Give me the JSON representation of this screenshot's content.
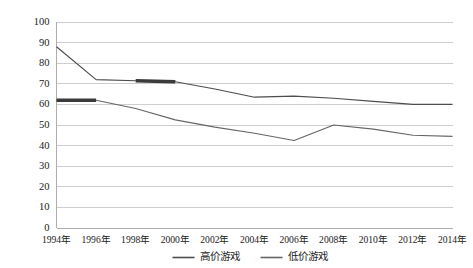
{
  "chart_data": {
    "type": "line",
    "title": "",
    "xlabel": "",
    "ylabel": "",
    "ylim": [
      0,
      100
    ],
    "ytick_step": 10,
    "grid": true,
    "legend_position": "bottom",
    "categories": [
      "1994年",
      "1996年",
      "1998年",
      "2000年",
      "2002年",
      "2004年",
      "2006年",
      "2008年",
      "2010年",
      "2012年",
      "2014年"
    ],
    "yticks": [
      "0",
      "10",
      "20",
      "30",
      "40",
      "50",
      "60",
      "70",
      "80",
      "90",
      "100"
    ],
    "series": [
      {
        "name": "高价游戏",
        "color": "#4d4d4d",
        "values": [
          88,
          72,
          71.5,
          71,
          67.5,
          63.5,
          64,
          63,
          61.5,
          60,
          60
        ],
        "emphasis_span": [
          2,
          3
        ]
      },
      {
        "name": "低价游戏",
        "color": "#666666",
        "values": [
          62,
          62,
          58,
          52.5,
          49,
          46,
          42.5,
          50,
          48,
          45,
          44.5
        ],
        "emphasis_span": [
          0,
          1
        ]
      }
    ],
    "colors": {
      "gridline": "#b9b9b9",
      "axis": "#9a9a9a",
      "text": "#1a1a1a",
      "background": "#ffffff",
      "emphasis": "#3a3a3a"
    }
  }
}
